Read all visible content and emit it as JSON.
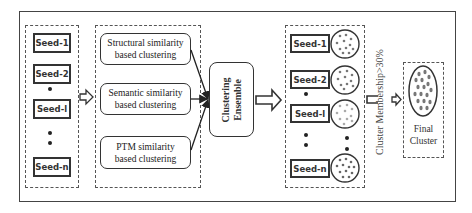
{
  "diagram": {
    "seeds_left": [
      {
        "label": "Seed-1"
      },
      {
        "label": "Seed-2"
      },
      {
        "label": "Seed-l"
      },
      {
        "label": "Seed-n"
      }
    ],
    "methods": [
      {
        "line1": "Structural  similarity",
        "line2": "based clustering"
      },
      {
        "line1": "Semantic  similarity",
        "line2": "based clustering"
      },
      {
        "line1": "PTM similarity",
        "line2": "based clustering"
      }
    ],
    "ensemble": {
      "line1": "Clustering",
      "line2": "Ensemble"
    },
    "seeds_right": [
      {
        "label": "Seed-1"
      },
      {
        "label": "Seed-2"
      },
      {
        "label": "Seed-l"
      },
      {
        "label": "Seed-n"
      }
    ],
    "filter_label": "Cluster Membership>30%",
    "final": {
      "line1": "Final",
      "line2": "Cluster"
    },
    "colors": {
      "stroke": "#333333",
      "dot_dark": "#666666",
      "dot_light": "#a8a8a8"
    }
  }
}
